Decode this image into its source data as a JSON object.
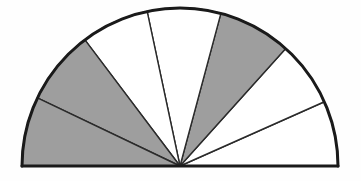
{
  "figure": {
    "kind": "semicircle-sector-diagram",
    "background_color": "#fefefe",
    "outline_color": "#1a1a1a",
    "divider_color": "#3c3c3c",
    "shaded_color": "#9e9e9e",
    "unshaded_color": "#ffffff",
    "center_x": 180,
    "center_y": 166,
    "radius": 158,
    "outline_width": 3,
    "divider_width": 1.4,
    "baseline_width": 3
  },
  "chart_data": {
    "type": "pie",
    "subtitle": "",
    "xlabel": "",
    "ylabel": "",
    "total_sweep_degrees": 180,
    "sector_count": 7,
    "boundary_angles_degrees": [
      0,
      24,
      48,
      75,
      102,
      127,
      154.5,
      180
    ],
    "categories": [
      "sector-1",
      "sector-2",
      "sector-3",
      "sector-4",
      "sector-5",
      "sector-6",
      "sector-7"
    ],
    "values": [
      24,
      24,
      27,
      27,
      25,
      27.5,
      25.5
    ],
    "fills": [
      "#ffffff",
      "#ffffff",
      "#9e9e9e",
      "#ffffff",
      "#ffffff",
      "#9e9e9e",
      "#9e9e9e"
    ],
    "shaded_flags": [
      false,
      false,
      true,
      false,
      false,
      true,
      true
    ],
    "shaded_count": 3,
    "unshaded_count": 4,
    "shaded_sweep_degrees": 80,
    "unshaded_sweep_degrees": 100,
    "legend": [],
    "grid": false,
    "sectors": [
      {
        "name": "sector-1",
        "start_deg": 0,
        "end_deg": 24,
        "sweep_deg": 24,
        "shaded": false,
        "fill": "#ffffff"
      },
      {
        "name": "sector-2",
        "start_deg": 24,
        "end_deg": 48,
        "sweep_deg": 24,
        "shaded": false,
        "fill": "#ffffff"
      },
      {
        "name": "sector-3",
        "start_deg": 48,
        "end_deg": 75,
        "sweep_deg": 27,
        "shaded": true,
        "fill": "#9e9e9e"
      },
      {
        "name": "sector-4",
        "start_deg": 75,
        "end_deg": 102,
        "sweep_deg": 27,
        "shaded": false,
        "fill": "#ffffff"
      },
      {
        "name": "sector-5",
        "start_deg": 102,
        "end_deg": 127,
        "sweep_deg": 25,
        "shaded": false,
        "fill": "#ffffff"
      },
      {
        "name": "sector-6",
        "start_deg": 127,
        "end_deg": 154.5,
        "sweep_deg": 27.5,
        "shaded": true,
        "fill": "#9e9e9e"
      },
      {
        "name": "sector-7",
        "start_deg": 154.5,
        "end_deg": 180,
        "sweep_deg": 25.5,
        "shaded": true,
        "fill": "#9e9e9e"
      }
    ]
  },
  "labels": {
    "alt_text": "A semicircle divided into seven wedge sectors radiating from the midpoint of its straight base; three of the sectors are filled with medium gray and four are left white."
  }
}
